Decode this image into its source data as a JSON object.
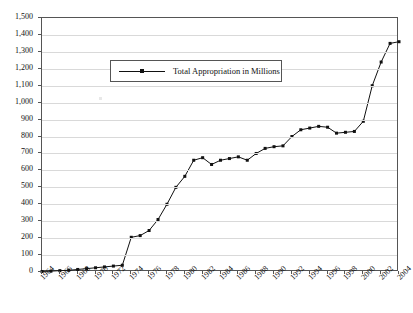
{
  "chart_data": {
    "type": "line",
    "title": "",
    "xlabel": "",
    "ylabel": "",
    "ylim": [
      0,
      1500
    ],
    "ytick_step": 100,
    "yticks": [
      "0",
      "100",
      "200",
      "300",
      "400",
      "500",
      "600",
      "700",
      "800",
      "900",
      "1,000",
      "1,100",
      "1,200",
      "1,300",
      "1,400",
      "1,500"
    ],
    "xlim": [
      1964,
      2004
    ],
    "xtick_step": 2,
    "xticks": [
      "1964",
      "1966",
      "1968",
      "1970",
      "1972",
      "1974",
      "1976",
      "1978",
      "1980",
      "1982",
      "1984",
      "1986",
      "1988",
      "1990",
      "1992",
      "1994",
      "1996",
      "1998",
      "2000",
      "2002",
      "2004"
    ],
    "grid": "horizontal",
    "legend_position": "top-left-inside",
    "series": [
      {
        "name": "Total Appropriation in Millions",
        "color": "#111111",
        "marker": "square",
        "x": [
          1964,
          1965,
          1966,
          1967,
          1968,
          1969,
          1970,
          1971,
          1972,
          1973,
          1974,
          1975,
          1976,
          1977,
          1978,
          1979,
          1980,
          1981,
          1982,
          1983,
          1984,
          1985,
          1986,
          1987,
          1988,
          1989,
          1990,
          1991,
          1992,
          1993,
          1994,
          1995,
          1996,
          1997,
          1998,
          1999,
          2000,
          2001,
          2002,
          2003,
          2004
        ],
        "values": [
          3,
          5,
          8,
          10,
          15,
          20,
          25,
          30,
          35,
          40,
          205,
          215,
          245,
          310,
          400,
          500,
          565,
          660,
          675,
          635,
          660,
          670,
          680,
          660,
          700,
          730,
          740,
          745,
          800,
          840,
          850,
          860,
          855,
          820,
          825,
          830,
          890,
          1100,
          1240,
          1350,
          1360
        ]
      }
    ]
  },
  "legend": {
    "label": "Total Appropriation in Millions"
  }
}
